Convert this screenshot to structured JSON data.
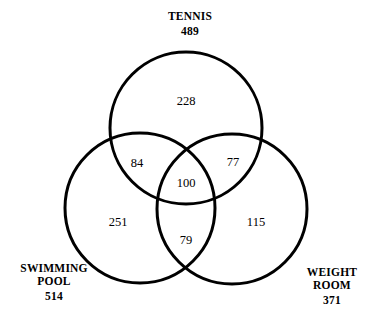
{
  "diagram": {
    "type": "venn-3-set",
    "title": "",
    "stroke_color": "#000000",
    "fill_color": "#ffffff",
    "background_color": "#ffffff",
    "stroke_width": 3,
    "sets": [
      {
        "id": "tennis",
        "name": "TENNIS",
        "total": "489",
        "circle": {
          "cx": 186,
          "cy": 128,
          "r": 76
        }
      },
      {
        "id": "swimming-pool",
        "name": "SWIMMING\nPOOL",
        "name_line1": "SWIMMING",
        "name_line2": "POOL",
        "total": "514",
        "circle": {
          "cx": 140,
          "cy": 208,
          "r": 75
        }
      },
      {
        "id": "weight-room",
        "name": "WEIGHT\nROOM",
        "name_line1": "WEIGHT",
        "name_line2": "ROOM",
        "total": "371",
        "circle": {
          "cx": 232,
          "cy": 209,
          "r": 75
        }
      }
    ],
    "regions": [
      {
        "id": "tennis-only",
        "label": "tennis only",
        "value": "228",
        "x": 186,
        "y": 101
      },
      {
        "id": "tennis-swim",
        "label": "tennis and swimming pool",
        "value": "84",
        "x": 137,
        "y": 163
      },
      {
        "id": "tennis-weight",
        "label": "tennis and weight room",
        "value": "77",
        "x": 233,
        "y": 162
      },
      {
        "id": "all-three",
        "label": "tennis, swimming pool, weight room",
        "value": "100",
        "x": 186,
        "y": 183
      },
      {
        "id": "swim-only",
        "label": "swimming pool only",
        "value": "251",
        "x": 118,
        "y": 222
      },
      {
        "id": "swim-weight",
        "label": "swimming pool and weight room",
        "value": "79",
        "x": 186,
        "y": 240
      },
      {
        "id": "weight-only",
        "label": "weight room only",
        "value": "115",
        "x": 256,
        "y": 222
      }
    ]
  },
  "chart_data": {
    "type": "diagram",
    "subtype": "venn",
    "title": "",
    "set_names": [
      "TENNIS",
      "SWIMMING POOL",
      "WEIGHT ROOM"
    ],
    "set_totals": [
      489,
      514,
      371
    ],
    "regions": {
      "tennis_only": 228,
      "tennis_and_swimming": 84,
      "tennis_and_weight": 77,
      "all_three": 100,
      "swimming_only": 251,
      "swimming_and_weight": 79,
      "weight_only": 115
    }
  }
}
